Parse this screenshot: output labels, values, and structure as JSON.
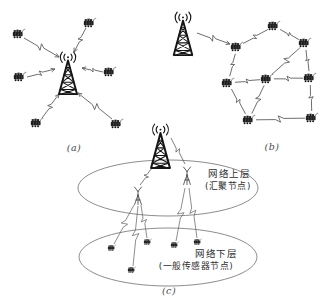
{
  "palette": {
    "bg": "#ffffff",
    "ink": "#161616",
    "link_line": "#5d5d5d",
    "ellipse_line": "#6f6f6f",
    "mast_line": "#3c3c3c",
    "label_text": "#2e2e2e",
    "caption_text": "#4a4a4a"
  },
  "figure": {
    "caption_a": "(a)",
    "caption_b": "(b)",
    "caption_c": "(c)",
    "upper_label_line1": "网络上层",
    "upper_label_line2": "(汇聚节点)",
    "lower_label_line1": "网络下层",
    "lower_label_line2": "(一般传感器节点)"
  },
  "diagram": {
    "canvas": {
      "w": 329,
      "h": 306
    },
    "subfig_a": {
      "type": "star",
      "tower": {
        "x": 55,
        "y": 48,
        "w": 26,
        "h": 48
      },
      "sensors": [
        [
          19,
          34
        ],
        [
          90,
          23
        ],
        [
          20,
          77
        ],
        [
          110,
          72
        ],
        [
          37,
          123
        ],
        [
          117,
          124
        ]
      ],
      "links": [
        [
          24,
          38,
          59,
          57
        ],
        [
          86,
          28,
          74,
          52
        ],
        [
          27,
          77,
          55,
          69
        ],
        [
          103,
          72,
          82,
          68
        ],
        [
          42,
          118,
          59,
          94
        ],
        [
          112,
          119,
          78,
          93
        ]
      ]
    },
    "subfig_b": {
      "type": "mesh",
      "tower": {
        "x": 169,
        "y": 8,
        "w": 28,
        "h": 49
      },
      "sensors": [
        [
          274,
          26
        ],
        [
          305,
          43
        ],
        [
          237,
          47
        ],
        [
          228,
          83
        ],
        [
          267,
          79
        ],
        [
          310,
          78
        ],
        [
          249,
          120
        ],
        [
          312,
          118
        ]
      ],
      "tower_link": [
        197,
        33,
        230,
        44
      ],
      "edges": [
        [
          2,
          0
        ],
        [
          0,
          1
        ],
        [
          2,
          3
        ],
        [
          1,
          4
        ],
        [
          1,
          5
        ],
        [
          3,
          4
        ],
        [
          4,
          5
        ],
        [
          3,
          6
        ],
        [
          4,
          6
        ],
        [
          5,
          7
        ],
        [
          6,
          7
        ]
      ]
    },
    "subfig_c": {
      "type": "hierarchy",
      "tower": {
        "x": 147,
        "y": 120,
        "w": 27,
        "h": 50
      },
      "ellipses": [
        [
          168,
          188,
          90,
          28
        ],
        [
          168,
          257,
          89,
          29
        ]
      ],
      "sinks": [
        [
          138,
          186
        ],
        [
          187,
          166
        ]
      ],
      "tower_links": [
        [
          152,
          168,
          140,
          185
        ],
        [
          171,
          138,
          185,
          164
        ]
      ],
      "sensors": [
        [
          112,
          248
        ],
        [
          148,
          242
        ],
        [
          132,
          270
        ],
        [
          175,
          245
        ],
        [
          198,
          242
        ]
      ],
      "sink_links": [
        [
          134,
          205,
          114,
          244
        ],
        [
          141,
          205,
          147,
          238
        ],
        [
          138,
          206,
          133,
          266
        ],
        [
          185,
          188,
          176,
          241
        ],
        [
          189,
          188,
          197,
          238
        ]
      ]
    }
  }
}
